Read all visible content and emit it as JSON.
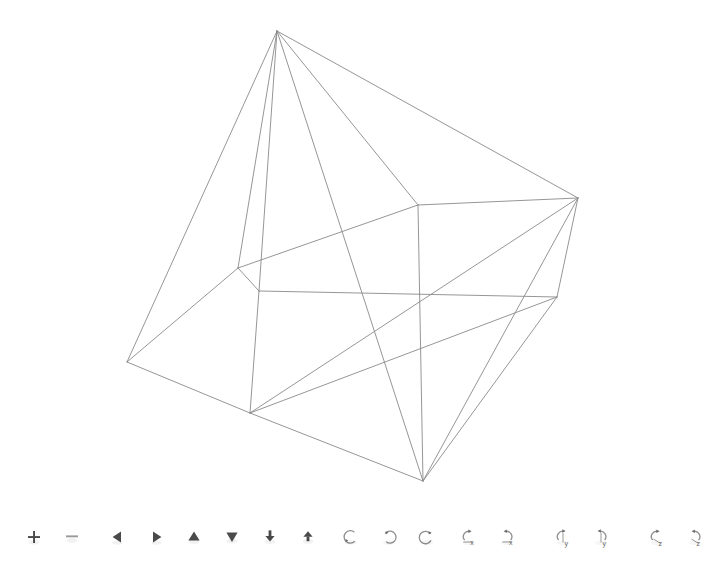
{
  "app": {
    "title": "3D Polyhedron Wireframe Viewer",
    "background_color": "#ffffff",
    "line_color": "#8a8a8a",
    "line_width": 0.9
  },
  "viewport": {
    "name": "polyhedron-wireframe-canvas",
    "width": 710,
    "height": 500,
    "shape_description": "Wireframe polyhedron drawn in thin gray lines on a white background",
    "vertices": [
      {
        "id": "v0",
        "label": "apex-top",
        "x": 277,
        "y": 31
      },
      {
        "id": "v1",
        "label": "right-upper",
        "x": 578,
        "y": 198
      },
      {
        "id": "v2",
        "label": "mid-upper-center",
        "x": 418,
        "y": 205
      },
      {
        "id": "v3",
        "label": "mid-left",
        "x": 238,
        "y": 268
      },
      {
        "id": "v4",
        "label": "mid-left-lower",
        "x": 259,
        "y": 291
      },
      {
        "id": "v5",
        "label": "right-mid",
        "x": 557,
        "y": 297
      },
      {
        "id": "v6",
        "label": "left-outer",
        "x": 127,
        "y": 362
      },
      {
        "id": "v7",
        "label": "lower-left",
        "x": 250,
        "y": 413
      },
      {
        "id": "v8",
        "label": "bottom-apex",
        "x": 423,
        "y": 481
      }
    ],
    "edges": [
      [
        "v0",
        "v6"
      ],
      [
        "v0",
        "v3"
      ],
      [
        "v0",
        "v4"
      ],
      [
        "v0",
        "v2"
      ],
      [
        "v0",
        "v8"
      ],
      [
        "v0",
        "v1"
      ],
      [
        "v1",
        "v2"
      ],
      [
        "v1",
        "v5"
      ],
      [
        "v1",
        "v8"
      ],
      [
        "v1",
        "v7"
      ],
      [
        "v2",
        "v3"
      ],
      [
        "v2",
        "v8"
      ],
      [
        "v3",
        "v4"
      ],
      [
        "v3",
        "v6"
      ],
      [
        "v4",
        "v5"
      ],
      [
        "v4",
        "v7"
      ],
      [
        "v5",
        "v7"
      ],
      [
        "v5",
        "v8"
      ],
      [
        "v6",
        "v7"
      ],
      [
        "v7",
        "v8"
      ]
    ]
  },
  "toolbar": {
    "name": "viewer-toolbar",
    "groups": [
      {
        "name": "zoom-group",
        "buttons": [
          {
            "name": "zoom-in-button",
            "icon": "plus-icon",
            "label": "Zoom In",
            "symbol": "+"
          },
          {
            "name": "zoom-out-button",
            "icon": "minus-icon",
            "label": "Zoom Out",
            "symbol": "−"
          }
        ]
      },
      {
        "name": "pan-group",
        "buttons": [
          {
            "name": "pan-left-button",
            "icon": "triangle-left-icon",
            "label": "Pan Left",
            "symbol": "◀"
          },
          {
            "name": "pan-right-button",
            "icon": "triangle-right-icon",
            "label": "Pan Right",
            "symbol": "▶"
          },
          {
            "name": "pan-up-button",
            "icon": "triangle-up-icon",
            "label": "Pan Up",
            "symbol": "▲"
          },
          {
            "name": "pan-down-button",
            "icon": "triangle-down-icon",
            "label": "Pan Down",
            "symbol": "▼"
          },
          {
            "name": "move-back-button",
            "icon": "arrow-down-to-bar-icon",
            "label": "Move Back",
            "symbol": "↧"
          },
          {
            "name": "move-fwd-button",
            "icon": "arrow-up-to-bar-icon",
            "label": "Move Forward",
            "symbol": "↥"
          }
        ]
      },
      {
        "name": "orbit-group",
        "buttons": [
          {
            "name": "orbit-ccw-button",
            "icon": "rotate-arc-left-icon",
            "label": "Orbit Counter-Clockwise"
          },
          {
            "name": "orbit-cw-button",
            "icon": "rotate-arc-right-icon",
            "label": "Orbit Clockwise"
          },
          {
            "name": "orbit-reset-button",
            "icon": "rotate-loop-icon",
            "label": "Reset Orbit"
          }
        ]
      },
      {
        "name": "axis-rotation-group",
        "buttons": [
          {
            "name": "rotate-x-pos-button",
            "icon": "rotate-axis-icon",
            "label": "Rotate +X",
            "axis": "x"
          },
          {
            "name": "rotate-x-neg-button",
            "icon": "rotate-axis-icon",
            "label": "Rotate -X",
            "axis": "x"
          },
          {
            "name": "rotate-y-pos-button",
            "icon": "rotate-axis-icon",
            "label": "Rotate +Y",
            "axis": "y"
          },
          {
            "name": "rotate-y-neg-button",
            "icon": "rotate-axis-icon",
            "label": "Rotate -Y",
            "axis": "y"
          },
          {
            "name": "rotate-z-pos-button",
            "icon": "rotate-axis-icon",
            "label": "Rotate +Z",
            "axis": "z"
          },
          {
            "name": "rotate-z-neg-button",
            "icon": "rotate-axis-icon",
            "label": "Rotate -Z",
            "axis": "z"
          }
        ]
      }
    ]
  }
}
